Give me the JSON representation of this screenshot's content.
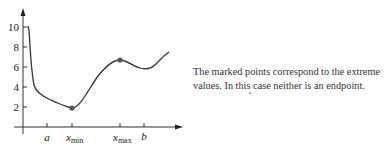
{
  "figure": {
    "y_ticks": [
      {
        "label": "10",
        "y": 27
      },
      {
        "label": "8",
        "y": 47
      },
      {
        "label": "6",
        "y": 67
      },
      {
        "label": "4",
        "y": 87
      },
      {
        "label": "2",
        "y": 107
      }
    ],
    "x_ticks": [
      {
        "label": "a",
        "sub": "",
        "x": 47
      },
      {
        "label": "x",
        "sub": "min",
        "x": 72
      },
      {
        "label": "x",
        "sub": "max",
        "x": 120
      },
      {
        "label": "b",
        "sub": "",
        "x": 144
      }
    ],
    "marked_points": [
      {
        "name": "minimum",
        "x_label": "x_min",
        "value": 2
      },
      {
        "name": "maximum",
        "x_label": "x_max",
        "value": 6.7
      }
    ],
    "curve_color": "#333333",
    "point_color": "#555555"
  },
  "caption": {
    "line1": "The marked points correspond to the extreme",
    "line2": "values. In this case neither is an endpoint."
  }
}
